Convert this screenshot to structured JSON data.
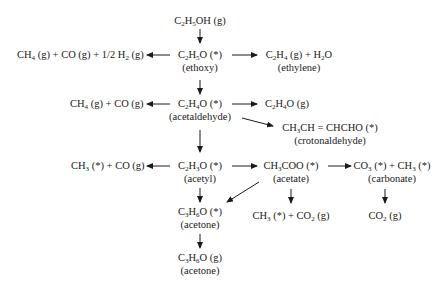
{
  "diagram": {
    "type": "reaction-pathway",
    "nodes": [
      {
        "id": "ethanol_g",
        "formula_html": "C<sub>2</sub>H<sub>5</sub>OH (g)",
        "label": ""
      },
      {
        "id": "ethoxy",
        "formula_html": "C<sub>2</sub>H<sub>5</sub>O (*)",
        "label": "(ethoxy)"
      },
      {
        "id": "ethoxy_decomp",
        "formula_html": "CH<sub>4</sub> (g) + CO (g) + 1/2 H<sub>2</sub> (g)",
        "label": ""
      },
      {
        "id": "ethylene",
        "formula_html": "C<sub>2</sub>H<sub>4</sub> (g) + H<sub>2</sub>O",
        "label": "(ethylene)"
      },
      {
        "id": "acetaldehyde",
        "formula_html": "C<sub>2</sub>H<sub>4</sub>O (*)",
        "label": "(acetaldehyde)"
      },
      {
        "id": "acetaldehyde_decomp",
        "formula_html": "CH<sub>4</sub> (g) + CO (g)",
        "label": ""
      },
      {
        "id": "acetaldehyde_g",
        "formula_html": "C<sub>2</sub>H<sub>4</sub>O (g)",
        "label": ""
      },
      {
        "id": "crotonaldehyde",
        "formula_html": "CH<sub>3</sub>CH = CHCHO (*)",
        "label": "(crotonaldehyde)"
      },
      {
        "id": "acetyl",
        "formula_html": "C<sub>2</sub>H<sub>3</sub>O (*)",
        "label": "(acetyl)"
      },
      {
        "id": "acetyl_decomp",
        "formula_html": "CH<sub>3</sub> (*) + CO (g)",
        "label": ""
      },
      {
        "id": "acetate",
        "formula_html": "CH<sub>3</sub>COO (*)",
        "label": "(acetate)"
      },
      {
        "id": "carbonate",
        "formula_html": "CO<sub>3</sub> (*) + CH<sub>3</sub> (*)",
        "label": "(carbonate)"
      },
      {
        "id": "acetone_ads",
        "formula_html": "C<sub>3</sub>H<sub>6</sub>O (*)",
        "label": "(acetone)"
      },
      {
        "id": "acetate_decomp",
        "formula_html": "CH<sub>3</sub> (*) + CO<sub>2</sub> (g)",
        "label": ""
      },
      {
        "id": "co2_g",
        "formula_html": "CO<sub>2</sub> (g)",
        "label": ""
      },
      {
        "id": "acetone_g",
        "formula_html": "C<sub>3</sub>H<sub>6</sub>O (g)",
        "label": "(acetone)"
      }
    ],
    "edges": [
      {
        "from": "ethanol_g",
        "to": "ethoxy"
      },
      {
        "from": "ethoxy",
        "to": "ethoxy_decomp"
      },
      {
        "from": "ethoxy",
        "to": "ethylene"
      },
      {
        "from": "ethoxy",
        "to": "acetaldehyde"
      },
      {
        "from": "acetaldehyde",
        "to": "acetaldehyde_decomp"
      },
      {
        "from": "acetaldehyde",
        "to": "acetaldehyde_g"
      },
      {
        "from": "acetaldehyde",
        "to": "crotonaldehyde"
      },
      {
        "from": "acetaldehyde",
        "to": "acetyl"
      },
      {
        "from": "acetyl",
        "to": "acetyl_decomp"
      },
      {
        "from": "acetyl",
        "to": "acetate"
      },
      {
        "from": "acetyl",
        "to": "acetone_ads"
      },
      {
        "from": "acetate",
        "to": "acetone_ads"
      },
      {
        "from": "acetate",
        "to": "acetate_decomp"
      },
      {
        "from": "acetate",
        "to": "carbonate"
      },
      {
        "from": "carbonate",
        "to": "co2_g"
      },
      {
        "from": "acetone_ads",
        "to": "acetone_g"
      }
    ]
  }
}
